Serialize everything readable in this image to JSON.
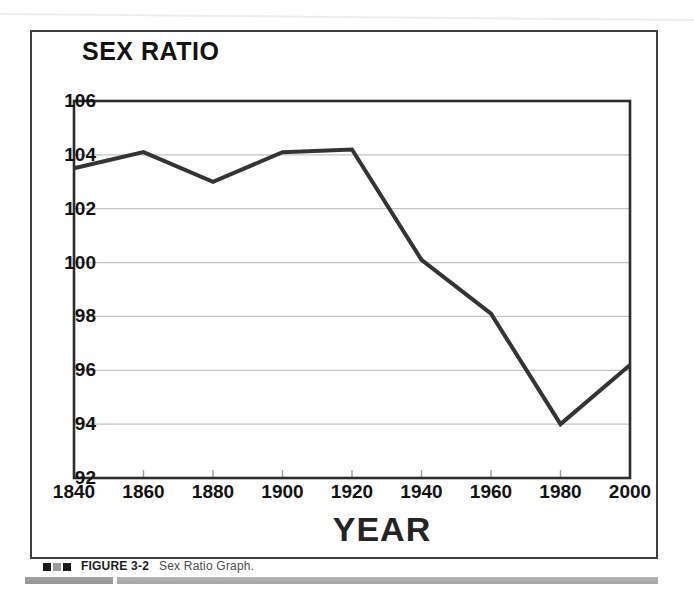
{
  "page": {
    "caption": {
      "marker_squares": [
        "#1a1a1a",
        "#9b9b9b",
        "#1a1a1a"
      ],
      "figure_label": "FIGURE 3-2",
      "figure_title": "Sex Ratio Graph."
    },
    "colors": {
      "data_line": "#343434",
      "gridline": "#c0c4c4",
      "plot_border": "#2d2d2d",
      "frame_border": "#3f3f3f",
      "tick_mark": "#9aa0a0",
      "bottom_bar_left": "#9a9a9a",
      "bottom_bar_right": "#adadad"
    }
  },
  "chart_data": {
    "type": "line",
    "title": "SEX RATIO",
    "xlabel": "YEAR",
    "ylabel": "",
    "x": [
      1840,
      1860,
      1880,
      1900,
      1920,
      1940,
      1960,
      1980,
      2000
    ],
    "values": [
      103.5,
      104.1,
      103.0,
      104.1,
      104.2,
      100.1,
      98.1,
      94.0,
      96.2
    ],
    "ylim": [
      92,
      106
    ],
    "yticks": [
      106,
      104,
      102,
      100,
      98,
      96,
      94,
      92
    ],
    "grid": "horizontal-only",
    "legend": "none",
    "line_width": 4
  }
}
